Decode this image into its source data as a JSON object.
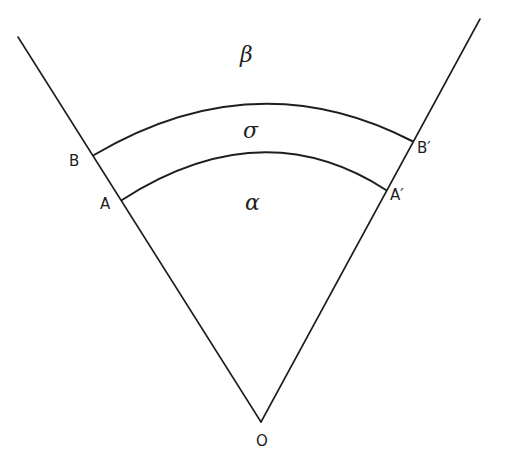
{
  "figure": {
    "colors": {
      "ink": "#1e1e1e",
      "background": "#ffffff"
    },
    "points": {
      "O": "O",
      "A": "A",
      "A_prime": "A′",
      "B": "B",
      "B_prime": "B′"
    },
    "regions": {
      "alpha": "α",
      "sigma": "σ",
      "beta": "β"
    }
  }
}
